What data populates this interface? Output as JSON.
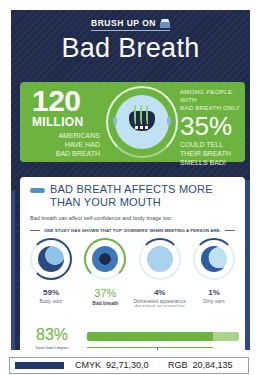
{
  "header": {
    "kicker": "BRUSH UP ON",
    "kicker_icon": "toothbrush-icon",
    "title": "Bad Breath"
  },
  "hero_stats": {
    "left": {
      "number": "120",
      "unit": "MILLION",
      "caption_lines": [
        "AMERICANS",
        "HAVE HAD",
        "BAD BREATH"
      ]
    },
    "center_icon": "bad-breath-face-icon",
    "right": {
      "lead_lines": [
        "AMONG PEOPLE WITH",
        "BAD BREATH ONLY"
      ],
      "percent": "35%",
      "caption_lines": [
        "COULD TELL",
        "THEIR BREATH",
        "SMELLS BAD!"
      ]
    }
  },
  "section": {
    "icon": "toothpaste-swoosh-icon",
    "title": "BAD BREATH AFFECTS MORE THAN YOUR MOUTH",
    "intro": "Bad breath can affect self-confidence and body image too:",
    "study_heading": "ONE STUDY HAS SHOWN THAT TOP 'DOWNERS' WHEN MEETING A PERSON ARE:",
    "downers": [
      {
        "percent": "59%",
        "label": "Body odor",
        "sublabel": "",
        "icon": "body-odor-icon",
        "highlighted": false
      },
      {
        "percent": "37%",
        "label": "Bad breath",
        "sublabel": "",
        "icon": "bad-breath-icon",
        "highlighted": true
      },
      {
        "percent": "4%",
        "label": "Disheveled appearance",
        "sublabel": "due to facial, ear or nasal hair",
        "icon": "disheveled-icon",
        "highlighted": false
      },
      {
        "percent": "1%",
        "label": "Dirty ears",
        "sublabel": "",
        "icon": "dirty-ears-icon",
        "highlighted": false
      }
    ],
    "impact": {
      "percent": "83%",
      "caption": "have had it impact their social lives",
      "bar_value": 83
    }
  },
  "swatch": {
    "color": "#1f3a6a",
    "cmyk_label": "CMYK",
    "cmyk_value": "92,71,30,0",
    "rgb_label": "RGB",
    "rgb_value": "20,84,135"
  },
  "colors": {
    "navy_background": "#1f2a4a",
    "accent_green": "#6cb43f",
    "light_green": "#a9d48a",
    "heading_blue": "#2c4a82",
    "icon_blue": "#4e8fd0"
  }
}
